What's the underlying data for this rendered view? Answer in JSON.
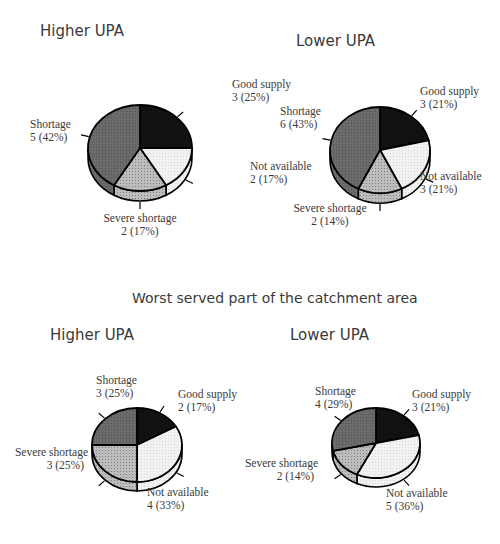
{
  "section_title": "Worst served part of the catchment area",
  "colors": {
    "good_supply": "#111111",
    "not_available": "#f2f2f2",
    "severe_shortage": "#bdbdbd",
    "shortage": "#6b6b6b",
    "outline": "#000000",
    "text": "#3a3a3a"
  },
  "chart_data": [
    {
      "type": "pie",
      "title": "Higher UPA",
      "group": "overall",
      "categories": [
        "Good supply",
        "Not available",
        "Severe shortage",
        "Shortage"
      ],
      "values": [
        3,
        2,
        2,
        5
      ],
      "percent": [
        25,
        17,
        17,
        42
      ],
      "labels": [
        "3 (25%)",
        "2 (17%)",
        "2 (17%)",
        "5 (42%)"
      ]
    },
    {
      "type": "pie",
      "title": "Lower UPA",
      "group": "overall",
      "categories": [
        "Good supply",
        "Not available",
        "Severe shortage",
        "Shortage"
      ],
      "values": [
        3,
        3,
        2,
        6
      ],
      "percent": [
        21,
        21,
        14,
        43
      ],
      "labels": [
        "3 (21%)",
        "3 (21%)",
        "2 (14%)",
        "6 (43%)"
      ]
    },
    {
      "type": "pie",
      "title": "Higher UPA",
      "group": "Worst served part of the catchment area",
      "categories": [
        "Good supply",
        "Not available",
        "Severe shortage",
        "Shortage"
      ],
      "values": [
        2,
        4,
        3,
        3
      ],
      "percent": [
        17,
        33,
        25,
        25
      ],
      "labels": [
        "2 (17%)",
        "4 (33%)",
        "3 (25%)",
        "3 (25%)"
      ]
    },
    {
      "type": "pie",
      "title": "Lower UPA",
      "group": "Worst served part of the catchment area",
      "categories": [
        "Good supply",
        "Not available",
        "Severe shortage",
        "Shortage"
      ],
      "values": [
        3,
        5,
        2,
        4
      ],
      "percent": [
        21,
        36,
        14,
        29
      ],
      "labels": [
        "3 (21%)",
        "5 (36%)",
        "2 (14%)",
        "4 (29%)"
      ]
    }
  ],
  "layout": [
    {
      "title_x": 40,
      "title_y": 22,
      "cx": 140,
      "cy": 148,
      "rx": 52,
      "ry": 43,
      "depth": 10,
      "label_pos": [
        [
          232,
          88,
          "start"
        ],
        [
          250,
          170,
          "start"
        ],
        [
          140,
          222,
          "middle"
        ],
        [
          30,
          128,
          "start"
        ]
      ]
    },
    {
      "title_x": 296,
      "title_y": 32,
      "cx": 380,
      "cy": 150,
      "rx": 50,
      "ry": 43,
      "depth": 10,
      "label_pos": [
        [
          420,
          95,
          "start"
        ],
        [
          420,
          180,
          "start"
        ],
        [
          330,
          212,
          "middle"
        ],
        [
          280,
          115,
          "start"
        ]
      ]
    },
    {
      "title_x": 50,
      "title_y": 326,
      "cx": 137,
      "cy": 445,
      "rx": 45,
      "ry": 37,
      "depth": 9,
      "label_pos": [
        [
          178,
          398,
          "start"
        ],
        [
          147,
          496,
          "start"
        ],
        [
          88,
          456,
          "end"
        ],
        [
          96,
          384,
          "start"
        ]
      ]
    },
    {
      "title_x": 290,
      "title_y": 326,
      "cx": 376,
      "cy": 443,
      "rx": 44,
      "ry": 35,
      "depth": 9,
      "label_pos": [
        [
          412,
          398,
          "start"
        ],
        [
          386,
          497,
          "start"
        ],
        [
          318,
          467,
          "end"
        ],
        [
          315,
          395,
          "start"
        ]
      ]
    }
  ]
}
